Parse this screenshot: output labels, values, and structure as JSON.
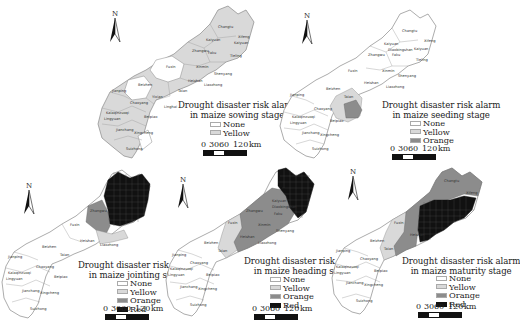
{
  "figure": {
    "panels": [
      {
        "id": "sowing",
        "caption_line1": "Drought disaster risk alarm",
        "caption_line2": "in maize sowing stage",
        "legend": [
          {
            "label": "None",
            "color": "#ffffff"
          },
          {
            "label": "Yellow",
            "color": "#d9d9d9"
          }
        ],
        "scale": {
          "ticks": [
            "0",
            "30",
            "60",
            "120"
          ],
          "unit": "km"
        },
        "north_label": "N"
      },
      {
        "id": "seeding",
        "caption_line1": "Drought disaster risk alarm",
        "caption_line2": "in maize seeding stage",
        "legend": [
          {
            "label": "None",
            "color": "#ffffff"
          },
          {
            "label": "Yellow",
            "color": "#d9d9d9"
          },
          {
            "label": "Orange",
            "color": "#8c8c8c"
          }
        ],
        "scale": {
          "ticks": [
            "0",
            "30",
            "60",
            "120"
          ],
          "unit": "km"
        },
        "north_label": "N"
      },
      {
        "id": "jointing",
        "caption_line1": "Drought disaster risk alarm",
        "caption_line2": "in maize jointing stage",
        "legend": [
          {
            "label": "None",
            "color": "#ffffff"
          },
          {
            "label": "Yellow",
            "color": "#d9d9d9"
          },
          {
            "label": "Orange",
            "color": "#8c8c8c"
          },
          {
            "label": "Red",
            "color": "#111111"
          }
        ],
        "scale": {
          "ticks": [
            "0",
            "30",
            "60",
            "120"
          ],
          "unit": "km"
        },
        "north_label": "N"
      },
      {
        "id": "heading",
        "caption_line1": "Drought disaster risk alarm",
        "caption_line2": "in maize heading stage",
        "legend": [
          {
            "label": "None",
            "color": "#ffffff"
          },
          {
            "label": "Yellow",
            "color": "#d9d9d9"
          },
          {
            "label": "Orange",
            "color": "#8c8c8c"
          },
          {
            "label": "Red",
            "color": "#111111"
          }
        ],
        "scale": {
          "ticks": [
            "0",
            "30",
            "60",
            "120"
          ],
          "unit": "km"
        },
        "north_label": "N"
      },
      {
        "id": "maturity",
        "caption_line1": "Drought disaster risk alarm",
        "caption_line2": "in maize maturity stage",
        "legend": [
          {
            "label": "None",
            "color": "#ffffff"
          },
          {
            "label": "Yellow",
            "color": "#d9d9d9"
          },
          {
            "label": "Orange",
            "color": "#8c8c8c"
          },
          {
            "label": "Red",
            "color": "#111111"
          }
        ],
        "scale": {
          "ticks": [
            "0",
            "30",
            "60",
            "120"
          ],
          "unit": "km"
        },
        "north_label": "N"
      }
    ],
    "districts": [
      "Changtu",
      "Xifeng",
      "Kaiyuan",
      "Tieling",
      "Diaobingshan",
      "Zhangwu",
      "Faku",
      "Xinmin",
      "Fuxin",
      "Shenyang",
      "Heishan",
      "Liaozhong",
      "Beizhen",
      "Taian",
      "Jinzhou",
      "Chaoyang",
      "Linghai",
      "Jianping",
      "Kalaqinzuoqi",
      "Lingyuan",
      "Beipiao",
      "Jianchang",
      "Xingcheng",
      "Suizhong",
      "Yixian",
      "Haicheng"
    ]
  }
}
